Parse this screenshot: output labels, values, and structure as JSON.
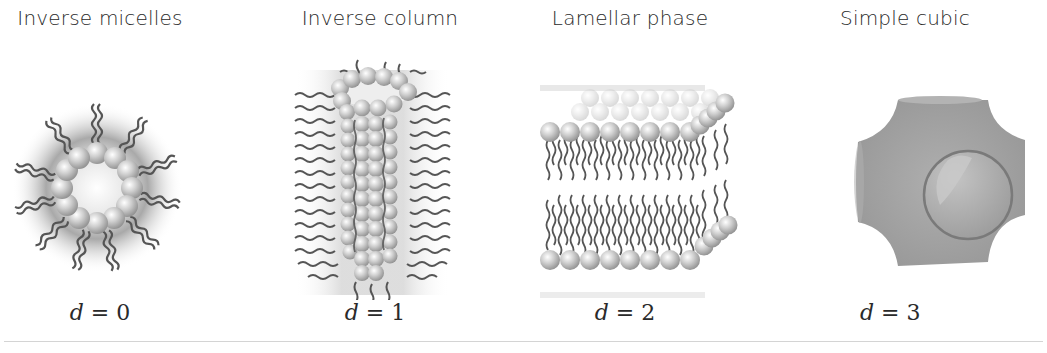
{
  "figure": {
    "panels": [
      {
        "title": "Inverse micelles",
        "dimension_symbol": "d",
        "equals": "=",
        "dimension_value": "0"
      },
      {
        "title": "Inverse column",
        "dimension_symbol": "d",
        "equals": "=",
        "dimension_value": "1"
      },
      {
        "title": "Lamellar phase",
        "dimension_symbol": "d",
        "equals": "=",
        "dimension_value": "2"
      },
      {
        "title": "Simple cubic",
        "dimension_symbol": "d",
        "equals": "=",
        "dimension_value": "3"
      }
    ],
    "colors": {
      "bead": "#bdbdbd",
      "tail": "#555555",
      "halo": "#9a9a9a",
      "cubic_body": "#9c9c9c",
      "rule": "#d4d4d4"
    }
  }
}
